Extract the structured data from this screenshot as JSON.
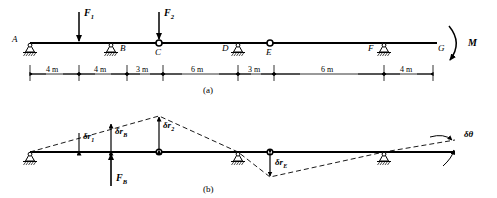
{
  "figure": {
    "subfigures": [
      {
        "id": "a",
        "label": "(a)"
      },
      {
        "id": "b",
        "label": "(b)"
      }
    ]
  },
  "diagram_a": {
    "points": [
      {
        "name": "A",
        "label": "A",
        "x": 30,
        "type": "pin-support"
      },
      {
        "name": "B",
        "label": "B",
        "x": 111,
        "type": "pin-support"
      },
      {
        "name": "C",
        "label": "C",
        "x": 159,
        "type": "hinge"
      },
      {
        "name": "D",
        "label": "D",
        "x": 222,
        "type": "plain"
      },
      {
        "name": "E",
        "label": "E",
        "x": 270,
        "type": "hinge"
      },
      {
        "name": "F",
        "label": "F",
        "x": 368,
        "type": "plain"
      },
      {
        "name": "G",
        "label": "G",
        "x": 430,
        "type": "beam-end"
      }
    ],
    "supports": [
      {
        "at": "A",
        "x": 30
      },
      {
        "at": "B",
        "x": 111
      },
      {
        "at": "D",
        "x": 238
      },
      {
        "at": "F",
        "x": 384
      }
    ],
    "loads": [
      {
        "name": "F1",
        "label": "F",
        "sub": "1",
        "x": 79,
        "direction": "down"
      },
      {
        "name": "F2",
        "label": "F",
        "sub": "2",
        "x": 159,
        "direction": "down"
      }
    ],
    "moment": {
      "label": "M",
      "x": 460,
      "direction": "clockwise"
    },
    "dimensions": [
      {
        "label": "4 m",
        "x0": 30,
        "x1": 79
      },
      {
        "label": "4 m",
        "x0": 79,
        "x1": 127
      },
      {
        "label": "3 m",
        "x0": 127,
        "x1": 163
      },
      {
        "label": "6 m",
        "x0": 163,
        "x1": 238
      },
      {
        "label": "3 m",
        "x0": 238,
        "x1": 274
      },
      {
        "label": "6 m",
        "x0": 274,
        "x1": 384
      },
      {
        "label": "4 m",
        "x0": 384,
        "x1": 433
      }
    ]
  },
  "diagram_b": {
    "points": [
      {
        "name": "A",
        "x": 30,
        "type": "pin-support"
      },
      {
        "name": "C",
        "x": 159,
        "type": "hinge"
      },
      {
        "name": "D",
        "x": 238,
        "type": "pin-support"
      },
      {
        "name": "E",
        "x": 270,
        "type": "hinge"
      },
      {
        "name": "F",
        "x": 384,
        "type": "pin-support"
      }
    ],
    "virtual_displacements": [
      {
        "name": "dr1",
        "label": "δr",
        "sub": "1",
        "x": 79,
        "direction": "up"
      },
      {
        "name": "drB",
        "label": "δr",
        "sub": "B",
        "x": 111,
        "direction": "up"
      },
      {
        "name": "dr2",
        "label": "δr",
        "sub": "2",
        "x": 159,
        "direction": "up"
      },
      {
        "name": "drE",
        "label": "δr",
        "sub": "E",
        "x": 270,
        "direction": "down"
      }
    ],
    "rotation": {
      "label": "δθ",
      "x": 462
    },
    "reaction": {
      "name": "FB",
      "label": "F",
      "sub": "B",
      "x": 111,
      "direction": "up"
    }
  },
  "colors": {
    "line": "#000000",
    "background": "#ffffff",
    "dashed": "#222222"
  }
}
